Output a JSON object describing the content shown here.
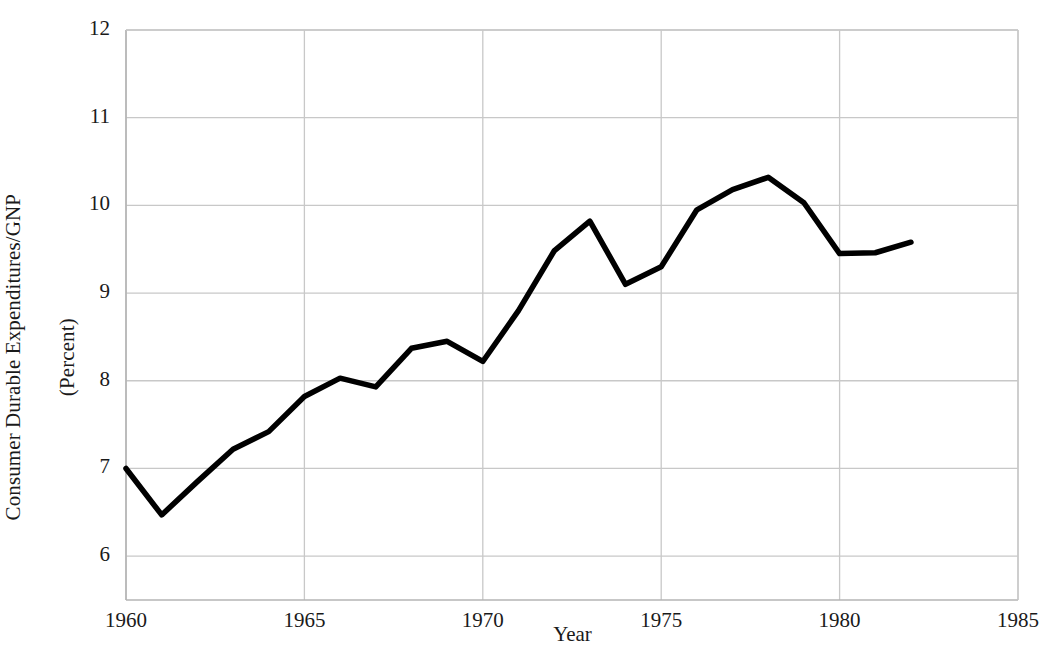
{
  "chart_data": {
    "type": "line",
    "title": "",
    "xlabel": "Year",
    "ylabel": "Consumer Durable Expenditures/GNP\n(Percent)",
    "ylabel_line1": "Consumer Durable Expenditures/GNP",
    "ylabel_line2": "(Percent)",
    "xlim": [
      1960,
      1985
    ],
    "ylim": [
      5.5,
      12
    ],
    "xticks": [
      1960,
      1965,
      1970,
      1975,
      1980,
      1985
    ],
    "yticks": [
      6,
      7,
      8,
      9,
      10,
      11,
      12
    ],
    "xtick_labels": [
      "1960",
      "1965",
      "1970",
      "1975",
      "1980",
      "1985"
    ],
    "ytick_labels": [
      "6",
      "7",
      "8",
      "9",
      "10",
      "11",
      "12"
    ],
    "grid": true,
    "legend": "none",
    "line_color": "#000000",
    "grid_color": "#c8c8c8",
    "x": [
      1960,
      1961,
      1962,
      1963,
      1964,
      1965,
      1966,
      1967,
      1968,
      1969,
      1970,
      1971,
      1972,
      1973,
      1974,
      1975,
      1976,
      1977,
      1978,
      1979,
      1980,
      1981,
      1982
    ],
    "values": [
      7.0,
      6.47,
      6.85,
      7.22,
      7.42,
      7.82,
      8.03,
      7.93,
      8.37,
      8.45,
      8.22,
      8.8,
      9.48,
      9.82,
      9.1,
      9.3,
      9.95,
      10.18,
      10.32,
      10.03,
      9.45,
      9.46,
      9.58
    ],
    "series": [
      {
        "name": "Consumer Durable Expenditures/GNP",
        "values": [
          7.0,
          6.47,
          6.85,
          7.22,
          7.42,
          7.82,
          8.03,
          7.93,
          8.37,
          8.45,
          8.22,
          8.8,
          9.48,
          9.82,
          9.1,
          9.3,
          9.95,
          10.18,
          10.32,
          10.03,
          9.45,
          9.46,
          9.58
        ]
      }
    ]
  }
}
